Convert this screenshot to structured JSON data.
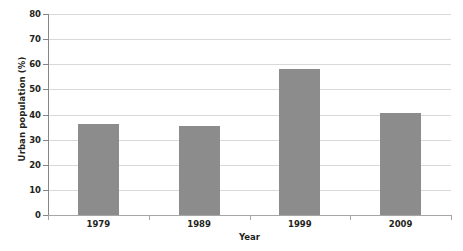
{
  "chart_data": {
    "type": "bar",
    "title": "",
    "subtitle": "",
    "categories": [
      "1979",
      "1989",
      "1999",
      "2009"
    ],
    "values": [
      36.2,
      35.5,
      58.0,
      40.5
    ],
    "series": [
      {
        "name": "Urban population",
        "values": [
          36.2,
          35.5,
          58.0,
          40.5
        ]
      }
    ],
    "xlabel": "Year",
    "ylabel": "Urban population (%)",
    "ylim": [
      0,
      80
    ],
    "ytick_labels": [
      "0",
      "10",
      "20",
      "30",
      "40",
      "50",
      "60",
      "70",
      "80"
    ],
    "ytick_values": [
      0,
      10,
      20,
      30,
      40,
      50,
      60,
      70,
      80
    ],
    "ytick_step": 10,
    "grid": "horizontal",
    "legend": "none",
    "bar_color": "#8c8c8c",
    "gridline_color": "#d9d9d9",
    "axis_color": "#868686",
    "text_color": "#231f20",
    "background_color": "#ffffff",
    "annotations": []
  },
  "axes": {
    "y_title": "Urban population (%)",
    "x_title": "Year"
  }
}
